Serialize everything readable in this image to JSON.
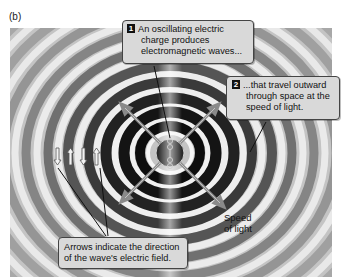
{
  "panel_label": "(b)",
  "callouts": {
    "step1": {
      "number": "1",
      "lines": [
        "An oscillating electric",
        "charge produces",
        "electromagnetic waves..."
      ]
    },
    "step2": {
      "number": "2",
      "lines": [
        "...that travel outward",
        "through space at the",
        "speed of light."
      ]
    },
    "field_note": {
      "lines": [
        "Arrows indicate the direction",
        "of the wave's electric field."
      ]
    }
  },
  "speed_label": {
    "lines": [
      "Speed",
      "of light"
    ]
  },
  "field_arrows": [
    "down",
    "up",
    "down",
    "up"
  ],
  "colors": {
    "background": "#bdbdbd",
    "dark_ring": "#111111",
    "light_ring": "#f2f2f2",
    "callout_fill": "#d9d9d9",
    "direction_arrow": "#888888"
  }
}
